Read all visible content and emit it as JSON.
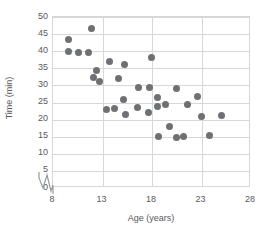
{
  "chart_data": {
    "type": "scatter",
    "title": "",
    "xlabel": "Age (years)",
    "ylabel": "Time (min)",
    "xlim": [
      8,
      28
    ],
    "ylim": [
      0,
      50
    ],
    "xticks": [
      8,
      13,
      18,
      23,
      28
    ],
    "yticks": [
      0,
      5,
      10,
      15,
      20,
      25,
      30,
      35,
      40,
      45,
      50
    ],
    "grid": true,
    "legend": null,
    "axis_break": {
      "axis": "x",
      "note": "zigzag break between 0 and 8 on the horizontal axis"
    },
    "marker_color": "#6f7073",
    "grid_color": "#d6d7d9",
    "text_color": "#58595b",
    "points": [
      {
        "x": 9.6,
        "y": 43.5
      },
      {
        "x": 9.6,
        "y": 40.0
      },
      {
        "x": 10.6,
        "y": 39.6
      },
      {
        "x": 11.6,
        "y": 39.6
      },
      {
        "x": 11.9,
        "y": 46.5
      },
      {
        "x": 12.4,
        "y": 34.4
      },
      {
        "x": 12.1,
        "y": 32.3
      },
      {
        "x": 12.7,
        "y": 31.2
      },
      {
        "x": 13.7,
        "y": 37.1
      },
      {
        "x": 13.4,
        "y": 22.9
      },
      {
        "x": 14.2,
        "y": 23.3
      },
      {
        "x": 14.6,
        "y": 31.9
      },
      {
        "x": 15.2,
        "y": 36.0
      },
      {
        "x": 15.1,
        "y": 25.9
      },
      {
        "x": 15.3,
        "y": 21.4
      },
      {
        "x": 16.6,
        "y": 29.5
      },
      {
        "x": 16.5,
        "y": 23.4
      },
      {
        "x": 17.7,
        "y": 29.4
      },
      {
        "x": 17.6,
        "y": 22.0
      },
      {
        "x": 17.9,
        "y": 38.3
      },
      {
        "x": 18.6,
        "y": 26.5
      },
      {
        "x": 18.6,
        "y": 23.9
      },
      {
        "x": 18.7,
        "y": 15.1
      },
      {
        "x": 19.4,
        "y": 24.5
      },
      {
        "x": 19.8,
        "y": 18.0
      },
      {
        "x": 20.5,
        "y": 29.2
      },
      {
        "x": 20.5,
        "y": 14.9
      },
      {
        "x": 21.2,
        "y": 15.1
      },
      {
        "x": 21.6,
        "y": 24.5
      },
      {
        "x": 22.6,
        "y": 26.7
      },
      {
        "x": 23.0,
        "y": 20.8
      },
      {
        "x": 23.8,
        "y": 15.3
      },
      {
        "x": 25.0,
        "y": 21.3
      }
    ]
  }
}
